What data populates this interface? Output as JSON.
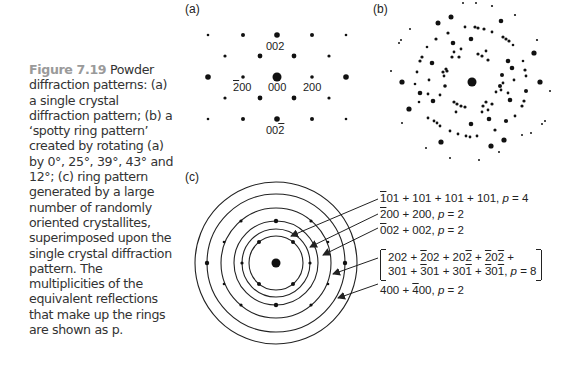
{
  "caption": {
    "figure_label": "Figure 7.19",
    "text": " Powder diffraction patterns: (a) a single crystal diffraction pattern; (b) a ‘spotty ring pattern’ created by rotating (a) by 0°, 25°, 39°, 43° and 12°; (c) ring pattern generated by a large number of randomly oriented crystallites, superimposed upon the single crystal diffraction pattern. The multiplicities of the equivalent reflections that make up the rings are shown as p."
  },
  "panels": {
    "a": {
      "label": "(a)",
      "spot_labels": {
        "top": "002",
        "left": "200",
        "center": "000",
        "right": "200",
        "bottom": "002"
      }
    },
    "b": {
      "label": "(b)",
      "rotations_deg": [
        0,
        25,
        39,
        43,
        12
      ]
    },
    "c": {
      "label": "(c)",
      "rings": [
        {
          "line": "1̄01 + 101 + 101 + 101, p = 4",
          "parts": [
            "1",
            "01 + 101 + 101 + 101, ",
            "p",
            " = 4"
          ],
          "multiplicity": 4
        },
        {
          "line": "2̄00 + 200, p = 2",
          "parts": [
            "2",
            "00 + 200, ",
            "p",
            " = 2"
          ],
          "multiplicity": 2
        },
        {
          "line": "0̄02 + 002, p = 2",
          "parts": [
            "0",
            "02 + 002, ",
            "p",
            " = 2"
          ],
          "multiplicity": 2
        },
        {
          "line1": "202 + 2̄02 + 202̄ + 2̄02̄ +",
          "line2": "301 + 3̄01 + 301̄ + 3̄01̄, p = 8",
          "multiplicity": 8
        },
        {
          "line": "400 + 4̄00, p = 2",
          "parts": [
            "400 + ",
            "4",
            "00, ",
            "p",
            " = 2"
          ],
          "multiplicity": 2
        }
      ]
    }
  }
}
